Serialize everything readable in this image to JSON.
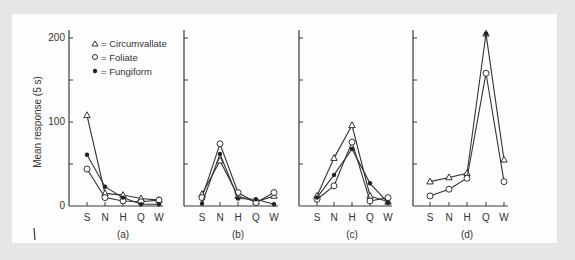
{
  "chart_data": [
    {
      "type": "line",
      "panel": "(a)",
      "categories": [
        "S",
        "N",
        "H",
        "Q",
        "W"
      ],
      "ylabel": "Mean response (5 s)",
      "ylim": [
        0,
        200
      ],
      "yticks": [
        0,
        50,
        100,
        150,
        200
      ],
      "ytick_labels": [
        "0",
        "",
        "100",
        "",
        "200"
      ],
      "series": [
        {
          "name": "Circumvallate",
          "marker": "triangle",
          "values": [
            108,
            15,
            13,
            9,
            7
          ]
        },
        {
          "name": "Foliate",
          "marker": "open-circle",
          "values": [
            44,
            10,
            6,
            5,
            7
          ]
        },
        {
          "name": "Fungiform",
          "marker": "filled-circle",
          "values": [
            61,
            23,
            10,
            2,
            2
          ]
        }
      ]
    },
    {
      "type": "line",
      "panel": "(b)",
      "categories": [
        "S",
        "N",
        "H",
        "Q",
        "W"
      ],
      "ylim": [
        0,
        200
      ],
      "series": [
        {
          "name": "Circumvallate",
          "marker": "triangle",
          "values": [
            14,
            54,
            12,
            5,
            12
          ]
        },
        {
          "name": "Foliate",
          "marker": "open-circle",
          "values": [
            10,
            74,
            16,
            4,
            16
          ]
        },
        {
          "name": "Fungiform",
          "marker": "filled-circle",
          "values": [
            3,
            62,
            9,
            8,
            2
          ]
        }
      ]
    },
    {
      "type": "line",
      "panel": "(c)",
      "categories": [
        "S",
        "N",
        "H",
        "Q",
        "W"
      ],
      "ylim": [
        0,
        200
      ],
      "series": [
        {
          "name": "Circumvallate",
          "marker": "triangle",
          "values": [
            12,
            57,
            96,
            12,
            5
          ]
        },
        {
          "name": "Foliate",
          "marker": "open-circle",
          "values": [
            8,
            24,
            76,
            6,
            10
          ]
        },
        {
          "name": "Fungiform",
          "marker": "filled-circle",
          "values": [
            10,
            37,
            68,
            27,
            4
          ]
        }
      ]
    },
    {
      "type": "line",
      "panel": "(d)",
      "categories": [
        "S",
        "N",
        "H",
        "Q",
        "W"
      ],
      "ylim": [
        0,
        200
      ],
      "series": [
        {
          "name": "Circumvallate",
          "marker": "triangle",
          "values": [
            29,
            34,
            39,
            205,
            55
          ]
        },
        {
          "name": "Foliate",
          "marker": "open-circle",
          "values": [
            12,
            20,
            33,
            158,
            29
          ]
        },
        {
          "name": "Fungiform",
          "marker": "filled-circle",
          "values": [
            null,
            null,
            null,
            205,
            null
          ]
        }
      ]
    }
  ],
  "figure": {
    "ylabel": "Mean response (5 s)",
    "ytick_labels": [
      "0",
      "100",
      "200"
    ],
    "panel_labels": [
      "(a)",
      "(b)",
      "(c)",
      "(d)"
    ],
    "category_labels": [
      "S",
      "N",
      "H",
      "Q",
      "W"
    ],
    "legend": [
      {
        "symbol": "△",
        "label": "= Circumvallate"
      },
      {
        "symbol": "○",
        "label": "= Foliate"
      },
      {
        "symbol": "●",
        "label": "= Fungiform"
      }
    ]
  }
}
